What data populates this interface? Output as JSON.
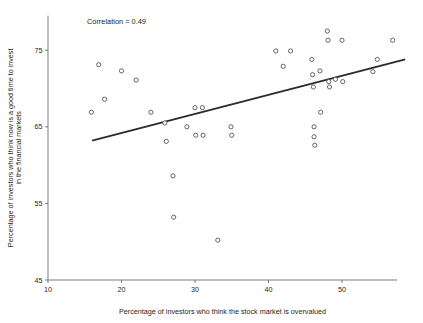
{
  "chart_data": {
    "type": "scatter",
    "title": "",
    "xlabel": "Percentage of investors who think the stock market is overvalued",
    "ylabel": "Percentage of investors who think now is a good time to invest in the financial markets",
    "ylabel_line1": "Percentage of investors who think now is a good time to invest",
    "ylabel_line2": "in the financial markets",
    "xlim": [
      10,
      57.5
    ],
    "ylim": [
      45,
      79.5
    ],
    "xticks": [
      10,
      20,
      30,
      40,
      50
    ],
    "xticklabels": [
      "10",
      "20",
      "30",
      "40",
      "50"
    ],
    "yticks": [
      45,
      55,
      65,
      75
    ],
    "yticklabels": [
      "45",
      "55",
      "65",
      "75"
    ],
    "grid": false,
    "legend": null,
    "annotations": [
      {
        "name": "correlation-annotation",
        "text": "Correlation = 0.49",
        "x": 15.3,
        "y": 78.4
      }
    ],
    "marker": {
      "shape": "circle-open",
      "radius_px": 2.1,
      "fill": "#ffffff",
      "edge_color": "#4b4b4d"
    },
    "trend_line": {
      "name": "regression-line",
      "color": "#2b2b2e",
      "x_start": 16.0,
      "y_start": 63.2,
      "x_end": 58.6,
      "y_end": 73.8
    },
    "points": [
      {
        "x": 15.9,
        "y": 66.9
      },
      {
        "x": 16.9,
        "y": 73.1
      },
      {
        "x": 17.7,
        "y": 68.6
      },
      {
        "x": 20.0,
        "y": 72.3
      },
      {
        "x": 22.0,
        "y": 71.1
      },
      {
        "x": 24.0,
        "y": 66.9
      },
      {
        "x": 25.9,
        "y": 65.5
      },
      {
        "x": 26.1,
        "y": 63.1
      },
      {
        "x": 27.0,
        "y": 58.6
      },
      {
        "x": 27.1,
        "y": 53.2
      },
      {
        "x": 28.9,
        "y": 65.0
      },
      {
        "x": 30.0,
        "y": 67.5
      },
      {
        "x": 30.1,
        "y": 63.9
      },
      {
        "x": 31.0,
        "y": 67.5
      },
      {
        "x": 31.1,
        "y": 63.9
      },
      {
        "x": 33.1,
        "y": 50.2
      },
      {
        "x": 34.9,
        "y": 65.0
      },
      {
        "x": 35.0,
        "y": 63.9
      },
      {
        "x": 41.0,
        "y": 74.9
      },
      {
        "x": 42.0,
        "y": 72.9
      },
      {
        "x": 43.0,
        "y": 74.9
      },
      {
        "x": 45.9,
        "y": 73.8
      },
      {
        "x": 46.0,
        "y": 71.8
      },
      {
        "x": 46.1,
        "y": 70.2
      },
      {
        "x": 46.2,
        "y": 65.0
      },
      {
        "x": 46.2,
        "y": 63.7
      },
      {
        "x": 46.3,
        "y": 62.6
      },
      {
        "x": 47.0,
        "y": 72.3
      },
      {
        "x": 47.1,
        "y": 66.9
      },
      {
        "x": 48.0,
        "y": 77.5
      },
      {
        "x": 48.1,
        "y": 76.3
      },
      {
        "x": 48.2,
        "y": 70.9
      },
      {
        "x": 48.3,
        "y": 70.2
      },
      {
        "x": 49.1,
        "y": 71.2
      },
      {
        "x": 50.0,
        "y": 76.3
      },
      {
        "x": 50.1,
        "y": 70.9
      },
      {
        "x": 54.2,
        "y": 72.2
      },
      {
        "x": 54.8,
        "y": 73.8
      },
      {
        "x": 56.9,
        "y": 76.3
      }
    ]
  }
}
